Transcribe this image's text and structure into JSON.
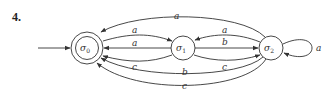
{
  "problem_number": "4.",
  "diagram": {
    "type": "finite-state-automaton",
    "start_state": "σ0",
    "states": [
      {
        "id": "s0",
        "symbol": "σ",
        "subscript": "0",
        "accepting": true
      },
      {
        "id": "s1",
        "symbol": "σ",
        "subscript": "1",
        "accepting": false
      },
      {
        "id": "s2",
        "symbol": "σ",
        "subscript": "2",
        "accepting": false
      }
    ],
    "transitions": [
      {
        "from": "σ0",
        "to": "σ1",
        "label": "a"
      },
      {
        "from": "σ1",
        "to": "σ0",
        "label": "a"
      },
      {
        "from": "σ1",
        "to": "σ0",
        "label": "c"
      },
      {
        "from": "σ2",
        "to": "σ0",
        "label": "a"
      },
      {
        "from": "σ1",
        "to": "σ2",
        "label": "b"
      },
      {
        "from": "σ2",
        "to": "σ1",
        "label": "a"
      },
      {
        "from": "σ1",
        "to": "σ2",
        "label": "c"
      },
      {
        "from": "σ2",
        "to": "σ0",
        "label": "b"
      },
      {
        "from": "σ2",
        "to": "σ0",
        "label": "c"
      },
      {
        "from": "σ2",
        "to": "σ2",
        "label": "a"
      }
    ],
    "labels": {
      "top_arc": "a",
      "s0_s1_upper": "a",
      "s0_s1_middle": "a",
      "s0_s1_lower": "c",
      "s1_s2_upper": "a",
      "s1_s2_middle": "b",
      "s1_s2_lower": "c",
      "bottom_arc_1": "b",
      "bottom_arc_2": "c",
      "self_loop": "a"
    },
    "state_symbol": "σ",
    "subscripts": {
      "s0": "0",
      "s1": "1",
      "s2": "2"
    }
  }
}
